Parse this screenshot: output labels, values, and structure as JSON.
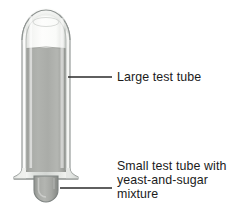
{
  "figure": {
    "background_color": "#ffffff",
    "callouts": [
      {
        "id": "large-test-tube",
        "label": "Large test tube",
        "leader_line": {
          "x1": 68,
          "y1": 77,
          "x2": 112,
          "y2": 77
        }
      },
      {
        "id": "small-test-tube",
        "label": "Small test tube with\nyeast-and-sugar\nmixture",
        "leader_line": {
          "x1": 60,
          "y1": 188,
          "x2": 112,
          "y2": 188
        }
      }
    ],
    "apparatus": {
      "large_tube": {
        "glass_color": "#cfd2cf",
        "glass_outline_color": "#8d9290",
        "highlight_color": "#f4f5f3"
      },
      "liquid": {
        "color": "#a9aaa6",
        "top_level_y": 48,
        "description": "gray liquid filling large tube"
      },
      "headspace": {
        "color": "#f7f7f5",
        "description": "white gas space above liquid at top of tube"
      },
      "small_tube": {
        "color": "#a7a9a5",
        "outline_color": "#7e8381",
        "description": "small inverted test tube protruding at bottom"
      }
    },
    "text_color": "#1b1b1b",
    "line_color": "#2a2a2a"
  }
}
